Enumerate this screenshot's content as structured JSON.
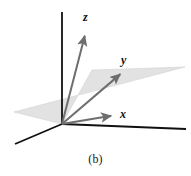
{
  "figure": {
    "caption": "(b)",
    "type": "3d-coordinate-axes-diagram",
    "background_color": "#ffffff",
    "plane": {
      "name": "shaded-plane",
      "fill_color": "#e2e2e2",
      "stroke_color": "#d2d2d2",
      "points": "62,124 92,70 185,67 14,112"
    },
    "axes": [
      {
        "name": "vertical-axis",
        "color": "#101010",
        "x1": 62,
        "y1": 12,
        "x2": 62,
        "y2": 124,
        "width": 1.8
      },
      {
        "name": "right-horizontal-axis",
        "color": "#101010",
        "x1": 62,
        "y1": 124,
        "x2": 186,
        "y2": 129,
        "width": 1.8
      },
      {
        "name": "lower-left-axis",
        "color": "#101010",
        "x1": 62,
        "y1": 124,
        "x2": 15,
        "y2": 144,
        "width": 1.8
      }
    ],
    "vectors": [
      {
        "name": "vector-z",
        "label": "z",
        "color": "#6e6e6e",
        "x1": 62,
        "y1": 124,
        "x2": 86,
        "y2": 31,
        "width": 2.0
      },
      {
        "name": "vector-y",
        "label": "y",
        "color": "#6e6e6e",
        "x1": 62,
        "y1": 124,
        "x2": 124,
        "y2": 71,
        "width": 2.0
      },
      {
        "name": "vector-x",
        "label": "x",
        "color": "#6e6e6e",
        "x1": 62,
        "y1": 124,
        "x2": 116,
        "y2": 115,
        "width": 2.0
      }
    ]
  }
}
